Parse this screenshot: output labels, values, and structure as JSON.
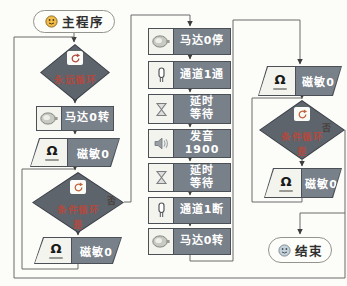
{
  "colors": {
    "block_fill": "#788089",
    "block_border": "#4a5056",
    "diamond_fill": "#5d646c",
    "accent_red": "#b04a40",
    "icon_cell_bg": "#f4f4ef",
    "connector_line": "#6a6a6a",
    "start_smiley": "#f2bc4a",
    "end_smiley": "#c6d2da"
  },
  "flow": {
    "start": {
      "label": "主程序"
    },
    "end": {
      "label": "结束"
    },
    "forever": {
      "label": "永远循环"
    },
    "left": {
      "motor_on": {
        "line1": "马达0转"
      },
      "sensor": {
        "line1": "磁敏0"
      },
      "while1": {
        "label": "条件循环",
        "no": "否",
        "yes": "是"
      },
      "sensor_body": {
        "line1": "磁敏0"
      }
    },
    "middle": [
      {
        "line1": "马达0停"
      },
      {
        "line1": "通道1通"
      },
      {
        "line1": "延时",
        "line2": "等待"
      },
      {
        "line1": "发音",
        "line2": "1900"
      },
      {
        "line1": "延时",
        "line2": "等待"
      },
      {
        "line1": "通道1断"
      },
      {
        "line1": "马达0转"
      }
    ],
    "right": {
      "sensor_top": {
        "line1": "磁敏0"
      },
      "while2": {
        "label": "条件循环",
        "no": "否",
        "yes": "是"
      },
      "sensor_body": {
        "line1": "磁敏0"
      }
    }
  }
}
